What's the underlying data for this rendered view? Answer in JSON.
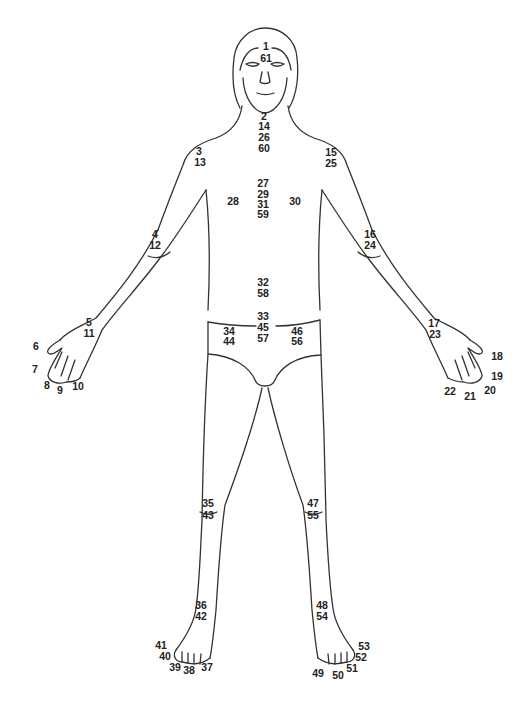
{
  "figure": {
    "stroke_color": "#333333",
    "label_color": "#222222",
    "labels": [
      {
        "text": "1",
        "x": 266,
        "y": 46
      },
      {
        "text": "61",
        "x": 266,
        "y": 58
      },
      {
        "text": "2",
        "x": 264,
        "y": 116
      },
      {
        "text": "14",
        "x": 264,
        "y": 126
      },
      {
        "text": "26",
        "x": 264,
        "y": 137
      },
      {
        "text": "60",
        "x": 264,
        "y": 148
      },
      {
        "text": "3",
        "x": 199,
        "y": 151
      },
      {
        "text": "13",
        "x": 200,
        "y": 162
      },
      {
        "text": "15",
        "x": 331,
        "y": 152
      },
      {
        "text": "25",
        "x": 331,
        "y": 163
      },
      {
        "text": "27",
        "x": 263,
        "y": 183
      },
      {
        "text": "29",
        "x": 263,
        "y": 194
      },
      {
        "text": "28",
        "x": 233,
        "y": 201
      },
      {
        "text": "31",
        "x": 263,
        "y": 204
      },
      {
        "text": "30",
        "x": 295,
        "y": 201
      },
      {
        "text": "59",
        "x": 263,
        "y": 214
      },
      {
        "text": "4",
        "x": 155,
        "y": 234
      },
      {
        "text": "12",
        "x": 155,
        "y": 245
      },
      {
        "text": "16",
        "x": 370,
        "y": 234
      },
      {
        "text": "24",
        "x": 370,
        "y": 245
      },
      {
        "text": "32",
        "x": 263,
        "y": 282
      },
      {
        "text": "58",
        "x": 263,
        "y": 293
      },
      {
        "text": "33",
        "x": 263,
        "y": 316
      },
      {
        "text": "45",
        "x": 263,
        "y": 327
      },
      {
        "text": "34",
        "x": 229,
        "y": 331
      },
      {
        "text": "46",
        "x": 297,
        "y": 331
      },
      {
        "text": "57",
        "x": 263,
        "y": 338
      },
      {
        "text": "44",
        "x": 229,
        "y": 341
      },
      {
        "text": "56",
        "x": 297,
        "y": 341
      },
      {
        "text": "5",
        "x": 89,
        "y": 322
      },
      {
        "text": "11",
        "x": 89,
        "y": 333
      },
      {
        "text": "17",
        "x": 434,
        "y": 323
      },
      {
        "text": "23",
        "x": 435,
        "y": 334
      },
      {
        "text": "6",
        "x": 36,
        "y": 346
      },
      {
        "text": "18",
        "x": 497,
        "y": 356
      },
      {
        "text": "7",
        "x": 35,
        "y": 369
      },
      {
        "text": "19",
        "x": 497,
        "y": 376
      },
      {
        "text": "8",
        "x": 47,
        "y": 385
      },
      {
        "text": "9",
        "x": 60,
        "y": 390
      },
      {
        "text": "10",
        "x": 78,
        "y": 386
      },
      {
        "text": "22",
        "x": 450,
        "y": 391
      },
      {
        "text": "20",
        "x": 490,
        "y": 390
      },
      {
        "text": "21",
        "x": 470,
        "y": 396
      },
      {
        "text": "35",
        "x": 208,
        "y": 503
      },
      {
        "text": "43",
        "x": 208,
        "y": 515
      },
      {
        "text": "47",
        "x": 313,
        "y": 503
      },
      {
        "text": "55",
        "x": 313,
        "y": 515
      },
      {
        "text": "36",
        "x": 201,
        "y": 605
      },
      {
        "text": "42",
        "x": 201,
        "y": 616
      },
      {
        "text": "48",
        "x": 322,
        "y": 605
      },
      {
        "text": "54",
        "x": 322,
        "y": 616
      },
      {
        "text": "41",
        "x": 161,
        "y": 645
      },
      {
        "text": "40",
        "x": 165,
        "y": 656
      },
      {
        "text": "39",
        "x": 175,
        "y": 667
      },
      {
        "text": "38",
        "x": 189,
        "y": 670
      },
      {
        "text": "37",
        "x": 207,
        "y": 667
      },
      {
        "text": "53",
        "x": 364,
        "y": 646
      },
      {
        "text": "52",
        "x": 361,
        "y": 657
      },
      {
        "text": "51",
        "x": 352,
        "y": 668
      },
      {
        "text": "50",
        "x": 338,
        "y": 675
      },
      {
        "text": "49",
        "x": 318,
        "y": 673
      }
    ]
  }
}
